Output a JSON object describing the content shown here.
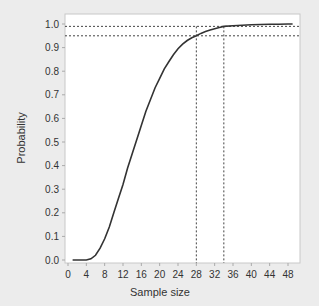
{
  "chart_data": {
    "type": "line",
    "title": "",
    "xlabel": "Sample size",
    "ylabel": "Probability",
    "xlim": [
      0,
      50
    ],
    "ylim": [
      0.0,
      1.0
    ],
    "x_ticks": [
      "0",
      "4",
      "8",
      "12",
      "16",
      "20",
      "24",
      "28",
      "32",
      "36",
      "40",
      "44",
      "48"
    ],
    "y_ticks": [
      "0.0",
      "0.1",
      "0.2",
      "0.3",
      "0.4",
      "0.5",
      "0.6",
      "0.7",
      "0.8",
      "0.9",
      "1.0"
    ],
    "grid": false,
    "legend": null,
    "series": [
      {
        "name": "Probability",
        "x": [
          1,
          2,
          3,
          4,
          5,
          6,
          7,
          8,
          9,
          10,
          11,
          12,
          13,
          14,
          15,
          16,
          17,
          18,
          19,
          20,
          21,
          22,
          23,
          24,
          25,
          26,
          27,
          28,
          29,
          30,
          31,
          32,
          33,
          34,
          36,
          38,
          40,
          42,
          44,
          46,
          48,
          49
        ],
        "values": [
          0.0,
          0.0,
          0.0,
          0.0,
          0.005,
          0.02,
          0.05,
          0.09,
          0.14,
          0.2,
          0.26,
          0.32,
          0.39,
          0.45,
          0.51,
          0.57,
          0.63,
          0.68,
          0.73,
          0.77,
          0.81,
          0.84,
          0.87,
          0.895,
          0.915,
          0.93,
          0.942,
          0.95,
          0.96,
          0.968,
          0.975,
          0.98,
          0.985,
          0.99,
          0.993,
          0.995,
          0.997,
          0.998,
          0.999,
          0.999,
          1.0,
          1.0
        ]
      }
    ],
    "reference_lines": {
      "horizontal": [
        0.99,
        0.95
      ],
      "vertical": [
        28,
        34
      ]
    }
  },
  "labels": {
    "xlabel": "Sample size",
    "ylabel": "Probability"
  }
}
